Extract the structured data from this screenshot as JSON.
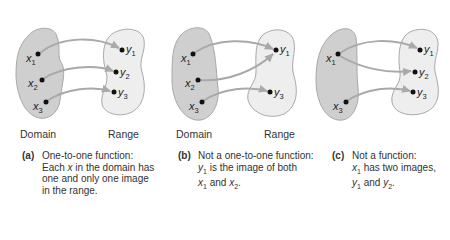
{
  "panels": [
    {
      "id": "a",
      "domain_points": [
        "x1",
        "x2",
        "x3"
      ],
      "range_points": [
        "y1",
        "y2",
        "y3"
      ],
      "mappings": [
        [
          "x1",
          "y1"
        ],
        [
          "x2",
          "y2"
        ],
        [
          "x3",
          "y3"
        ]
      ],
      "domain_label": "Domain",
      "range_label": "Range",
      "caption_tag": "(a)",
      "caption_lines": [
        "One-to-one function:",
        "Each x in the domain has",
        "one and only one image",
        "in the range."
      ]
    },
    {
      "id": "b",
      "domain_points": [
        "x1",
        "x2",
        "x3"
      ],
      "range_points": [
        "y1",
        "y3"
      ],
      "mappings": [
        [
          "x1",
          "y1"
        ],
        [
          "x2",
          "y1"
        ],
        [
          "x3",
          "y3"
        ]
      ],
      "domain_label": "Domain",
      "range_label": "Range",
      "caption_tag": "(b)",
      "caption_lines": [
        "Not a one-to-one function:",
        "y1 is the image of both",
        "x1 and x2."
      ]
    },
    {
      "id": "c",
      "domain_points": [
        "x1",
        "x3"
      ],
      "range_points": [
        "y1",
        "y2",
        "y3"
      ],
      "mappings": [
        [
          "x1",
          "y1"
        ],
        [
          "x1",
          "y2"
        ],
        [
          "x3",
          "y3"
        ]
      ],
      "caption_tag": "(c)",
      "caption_lines": [
        "Not a function:",
        "x1 has two images,",
        "y1 and y2."
      ]
    }
  ],
  "colors": {
    "domain_fill": "#cfcfcf",
    "range_fill": "#eeeeee",
    "outline": "#a8a8a8",
    "arrow": "#a9a9a9",
    "dot": "#111111"
  }
}
